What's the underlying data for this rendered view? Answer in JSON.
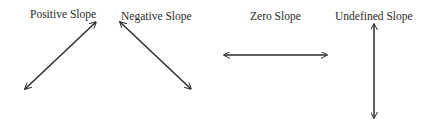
{
  "diagram": {
    "labels": {
      "positive": "Positive Slope",
      "negative": "Negative Slope",
      "zero": "Zero Slope",
      "undefined": "Undefined Slope"
    },
    "lines": [
      {
        "name": "positive",
        "x1": 25,
        "y1": 89,
        "x2": 96,
        "y2": 22
      },
      {
        "name": "negative",
        "x1": 120,
        "y1": 22,
        "x2": 191,
        "y2": 89
      },
      {
        "name": "zero",
        "x1": 224,
        "y1": 55,
        "x2": 327,
        "y2": 55
      },
      {
        "name": "undefined",
        "x1": 374,
        "y1": 24,
        "x2": 374,
        "y2": 118
      }
    ],
    "line_color": "#2a2a2a"
  }
}
